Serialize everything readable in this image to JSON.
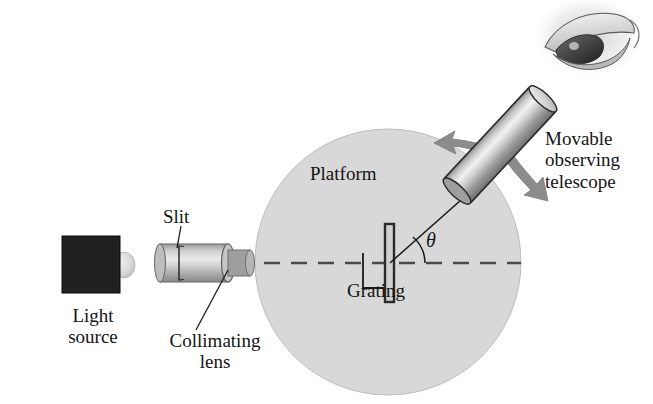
{
  "figure": {
    "labels": {
      "light_source": "Light\nsource",
      "slit": "Slit",
      "collimating_lens": "Collimating\nlens",
      "platform": "Platform",
      "grating": "Grating",
      "angle": "θ",
      "telescope": "Movable\nobserving\ntelescope"
    },
    "colors": {
      "platform_fill": "#d8d8d8",
      "platform_stroke": "#b4b4b4",
      "tube_light": "#e4e4e4",
      "tube_mid": "#a8a8a8",
      "tube_dark": "#6e6e6e",
      "source_box": "#212121",
      "bulb": "#d2d2d2",
      "arrow_gray": "#8c8c8c",
      "line_black": "#1a1a1a",
      "grating_bar": "#3a3a3a",
      "background": "#ffffff"
    },
    "geometry": {
      "platform_center_x": 388,
      "platform_center_y": 262,
      "platform_radius": 133,
      "optical_axis_y": 263,
      "telescope_angle_deg": 48
    }
  }
}
